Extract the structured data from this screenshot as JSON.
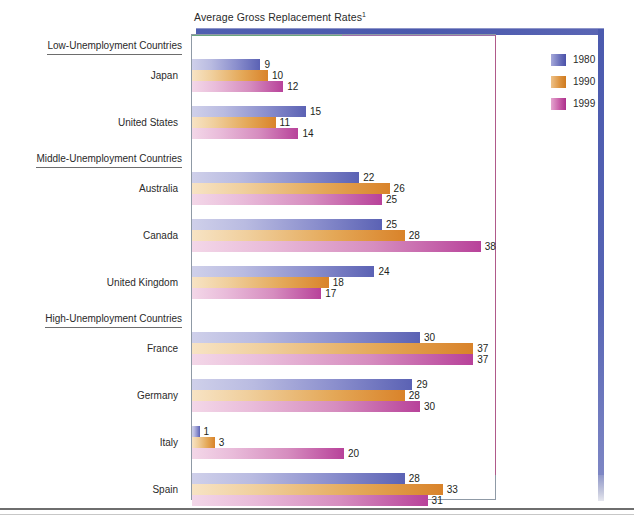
{
  "chart_data": {
    "type": "bar",
    "orientation": "horizontal",
    "title": "Average Gross Replacement Rates",
    "title_footnote_marker": "1",
    "xlabel": "",
    "ylabel": "",
    "xlim": [
      0,
      40
    ],
    "grid": false,
    "legend_position": "right",
    "categories": [
      "Japan",
      "United States",
      "Australia",
      "Canada",
      "United Kingdom",
      "France",
      "Germany",
      "Italy",
      "Spain"
    ],
    "group_headers": [
      {
        "label": "Low-Unemployment Countries",
        "members": [
          "Japan",
          "United States"
        ]
      },
      {
        "label": "Middle-Unemployment Countries",
        "members": [
          "Australia",
          "Canada",
          "United Kingdom"
        ]
      },
      {
        "label": "High-Unemployment Countries",
        "members": [
          "France",
          "Germany",
          "Italy",
          "Spain"
        ]
      }
    ],
    "series": [
      {
        "name": "1980",
        "color": "#5b62b4",
        "values": [
          9,
          15,
          22,
          25,
          24,
          30,
          29,
          1,
          28
        ]
      },
      {
        "name": "1990",
        "color": "#d9832a",
        "values": [
          10,
          11,
          26,
          28,
          18,
          37,
          28,
          3,
          33
        ]
      },
      {
        "name": "1999",
        "color": "#b8429a",
        "values": [
          12,
          14,
          25,
          38,
          17,
          37,
          30,
          20,
          31
        ]
      }
    ]
  },
  "legend": {
    "items": [
      {
        "label": "1980",
        "key": "y1980"
      },
      {
        "label": "1990",
        "key": "y1990"
      },
      {
        "label": "1999",
        "key": "y1999"
      }
    ]
  },
  "colors": {
    "series_1980": "#5b62b4",
    "series_1990": "#d9832a",
    "series_1999": "#b8429a",
    "frame_border": "#8f9aa6",
    "decor_bar": "#4a59ad",
    "text": "#231f20"
  }
}
